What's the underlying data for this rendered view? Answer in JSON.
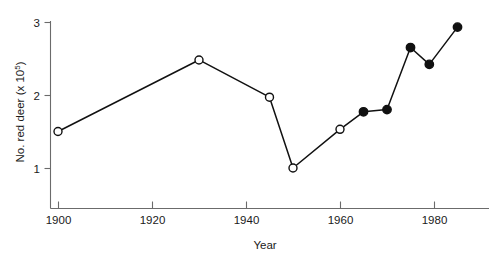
{
  "chart_data": {
    "type": "line",
    "title": "",
    "xlabel": "Year",
    "ylabel": "No. red deer (x 10⁵)",
    "ylabel_main": "No. red deer (x 10",
    "ylabel_exponent": "5",
    "ylabel_tail": ")",
    "xlim": [
      1896,
      1989
    ],
    "ylim": [
      0.82,
      3.05
    ],
    "xticks": [
      1900,
      1920,
      1940,
      1960,
      1980
    ],
    "xtick_labels": [
      "1900",
      "1920",
      "1940",
      "1960",
      "1980"
    ],
    "yticks": [
      1,
      2,
      3
    ],
    "ytick_labels": [
      "1",
      "2",
      "3"
    ],
    "grid": false,
    "legend": null,
    "x": [
      1900,
      1930,
      1945,
      1950,
      1960,
      1965,
      1970,
      1975,
      1979,
      1985
    ],
    "values": [
      1.5,
      2.48,
      1.97,
      1.0,
      1.53,
      1.77,
      1.8,
      2.65,
      2.42,
      2.93
    ],
    "marker_styles": [
      "open",
      "open",
      "open",
      "open",
      "open",
      "filled",
      "filled",
      "filled",
      "filled",
      "filled"
    ],
    "points": [
      {
        "year": 1900,
        "value": 1.5,
        "marker": "open"
      },
      {
        "year": 1930,
        "value": 2.48,
        "marker": "open"
      },
      {
        "year": 1945,
        "value": 1.97,
        "marker": "open"
      },
      {
        "year": 1950,
        "value": 1.0,
        "marker": "open"
      },
      {
        "year": 1960,
        "value": 1.53,
        "marker": "open"
      },
      {
        "year": 1965,
        "value": 1.77,
        "marker": "filled"
      },
      {
        "year": 1970,
        "value": 1.8,
        "marker": "filled"
      },
      {
        "year": 1975,
        "value": 2.65,
        "marker": "filled"
      },
      {
        "year": 1979,
        "value": 2.42,
        "marker": "filled"
      },
      {
        "year": 1985,
        "value": 2.93,
        "marker": "filled"
      }
    ],
    "colors": {
      "line": "#111111",
      "axis": "#6b6b6b",
      "marker_fill_open": "#ffffff",
      "marker_fill_closed": "#111111",
      "text": "#1a1a1a",
      "background": "#ffffff"
    }
  }
}
